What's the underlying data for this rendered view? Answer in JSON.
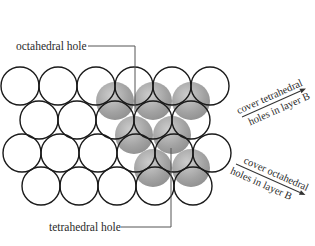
{
  "diagram": {
    "labels": {
      "octahedral_hole": "octahedral hole",
      "tetrahedral_hole": "tetrahedral hole",
      "cover_tetrahedral_line1": "cover tetrahedral",
      "cover_tetrahedral_line2": "holes in layer B",
      "cover_octahedral_line1": "cover octahedral",
      "cover_octahedral_line2": "holes in layer B"
    },
    "colors": {
      "outline": "#1a1a1a",
      "sphere_fill": "#9a9a9a",
      "sphere_highlight": "#c8c8c8",
      "leader_line": "#555555",
      "text": "#2a2a2a"
    },
    "layer_a": {
      "radius": 19,
      "rows": [
        {
          "y": 86,
          "x": [
            20,
            58,
            96,
            134,
            172,
            210
          ]
        },
        {
          "y": 120,
          "x": [
            39,
            77,
            115,
            153,
            191
          ]
        },
        {
          "y": 153,
          "x": [
            22,
            60,
            98,
            136,
            174,
            212
          ]
        },
        {
          "y": 186,
          "x": [
            41,
            79,
            117,
            155,
            193
          ]
        }
      ]
    },
    "layer_b": {
      "radius": 19,
      "spheres": [
        {
          "x": 115,
          "y": 101
        },
        {
          "x": 153,
          "y": 101
        },
        {
          "x": 191,
          "y": 101
        },
        {
          "x": 134,
          "y": 135
        },
        {
          "x": 172,
          "y": 135
        },
        {
          "x": 153,
          "y": 168
        },
        {
          "x": 191,
          "y": 168
        }
      ]
    }
  }
}
